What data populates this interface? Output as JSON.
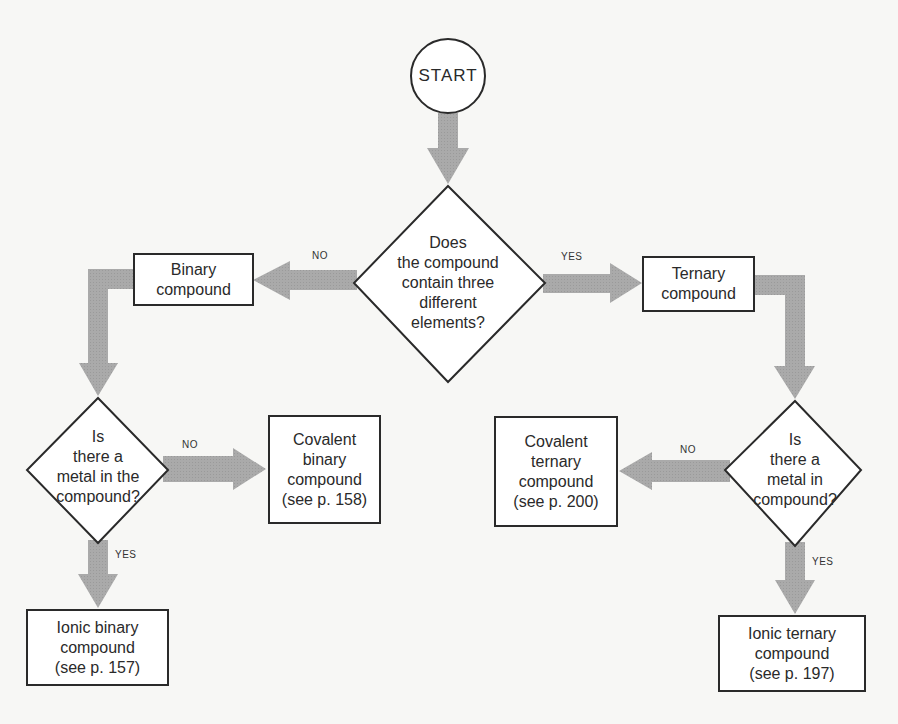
{
  "diagram": {
    "type": "flowchart",
    "topic": "Classifying compounds",
    "colors": {
      "arrow": "#a9a9a9",
      "outline": "#2a2a2a",
      "background": "#f7f7f5",
      "node_fill": "#ffffff"
    },
    "nodes": {
      "start": {
        "shape": "circle",
        "label": "START"
      },
      "q_three_elements": {
        "shape": "diamond",
        "lines": [
          "Does",
          "the compound",
          "contain three",
          "different",
          "elements?"
        ]
      },
      "binary": {
        "shape": "rect",
        "lines": [
          "Binary",
          "compound"
        ]
      },
      "ternary": {
        "shape": "rect",
        "lines": [
          "Ternary",
          "compound"
        ]
      },
      "q_metal_binary": {
        "shape": "diamond",
        "lines": [
          "Is",
          "there a",
          "metal in the",
          "compound?"
        ]
      },
      "q_metal_ternary": {
        "shape": "diamond",
        "lines": [
          "Is",
          "there a",
          "metal in",
          "compound?"
        ]
      },
      "covalent_binary": {
        "shape": "rect",
        "lines": [
          "Covalent",
          "binary",
          "compound",
          "(see p. 158)"
        ]
      },
      "covalent_ternary": {
        "shape": "rect",
        "lines": [
          "Covalent",
          "ternary",
          "compound",
          "(see p. 200)"
        ]
      },
      "ionic_binary": {
        "shape": "rect",
        "lines": [
          "Ionic binary",
          "compound",
          "(see p. 157)"
        ]
      },
      "ionic_ternary": {
        "shape": "rect",
        "lines": [
          "Ionic ternary",
          "compound",
          "(see p. 197)"
        ]
      }
    },
    "edges": [
      {
        "from": "start",
        "to": "q_three_elements",
        "label": ""
      },
      {
        "from": "q_three_elements",
        "to": "binary",
        "label": "NO"
      },
      {
        "from": "q_three_elements",
        "to": "ternary",
        "label": "YES"
      },
      {
        "from": "binary",
        "to": "q_metal_binary",
        "label": ""
      },
      {
        "from": "ternary",
        "to": "q_metal_ternary",
        "label": ""
      },
      {
        "from": "q_metal_binary",
        "to": "covalent_binary",
        "label": "NO"
      },
      {
        "from": "q_metal_binary",
        "to": "ionic_binary",
        "label": "YES"
      },
      {
        "from": "q_metal_ternary",
        "to": "covalent_ternary",
        "label": "NO"
      },
      {
        "from": "q_metal_ternary",
        "to": "ionic_ternary",
        "label": "YES"
      }
    ]
  }
}
